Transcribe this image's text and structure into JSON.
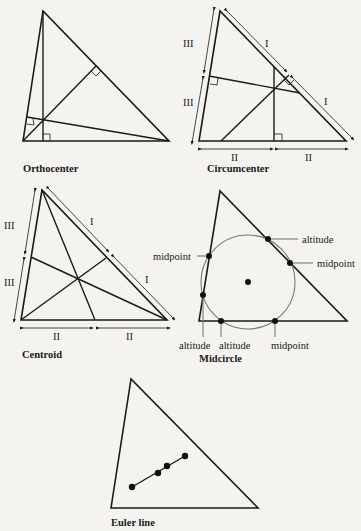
{
  "figures": [
    {
      "id": "orthocenter",
      "caption": "Orthocenter"
    },
    {
      "id": "circumcenter",
      "caption": "Circumcenter",
      "side_marks": [
        "I",
        "I",
        "II",
        "II",
        "III",
        "III"
      ]
    },
    {
      "id": "centroid",
      "caption": "Centroid",
      "side_marks": [
        "I",
        "I",
        "II",
        "II",
        "III",
        "III"
      ]
    },
    {
      "id": "midcircle",
      "caption": "Midcircle",
      "point_labels": [
        "altitude",
        "midpoint",
        "midpoint",
        "altitude",
        "altitude",
        "midpoint"
      ]
    },
    {
      "id": "euler",
      "caption": "Euler line"
    }
  ],
  "labels": {
    "orthocenter": "Orthocenter",
    "circumcenter": "Circumcenter",
    "centroid": "Centroid",
    "midcircle": "Midcircle",
    "euler": "Euler line",
    "roman_I": "I",
    "roman_II": "II",
    "roman_III": "III",
    "altitude": "altitude",
    "midpoint": "midpoint"
  },
  "colors": {
    "ink": "#1a1a1a",
    "circle": "#777777",
    "background": "#f4f3ef"
  }
}
